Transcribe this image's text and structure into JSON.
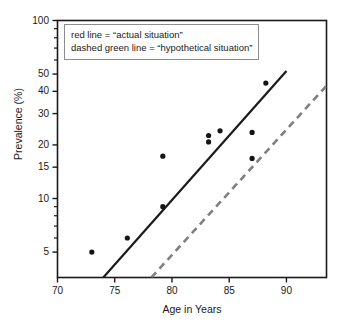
{
  "chart_data": {
    "type": "scatter",
    "title": "",
    "xlabel": "Age in Years",
    "ylabel": "Prevalence (%)",
    "yscale": "log",
    "xlim": [
      70,
      93.5
    ],
    "ylim": [
      3.6,
      100
    ],
    "grid": false,
    "x_ticks": [
      70,
      75,
      80,
      85,
      90
    ],
    "x_tick_labels": [
      "70",
      "75",
      "80",
      "85",
      "90"
    ],
    "y_ticks": [
      5,
      10,
      15,
      20,
      30,
      40,
      50,
      100
    ],
    "y_tick_labels": [
      "5",
      "10",
      "15",
      "20",
      "30",
      "40",
      "50",
      "100"
    ],
    "y_minor_ticks": [
      6,
      7,
      8,
      9,
      60,
      70,
      80,
      90
    ],
    "points": [
      {
        "x": 73.0,
        "y": 5.0
      },
      {
        "x": 76.1,
        "y": 6.0
      },
      {
        "x": 79.2,
        "y": 9.0
      },
      {
        "x": 79.2,
        "y": 17.3
      },
      {
        "x": 83.2,
        "y": 20.8
      },
      {
        "x": 83.2,
        "y": 22.6
      },
      {
        "x": 84.2,
        "y": 24.0
      },
      {
        "x": 87.0,
        "y": 16.8
      },
      {
        "x": 87.0,
        "y": 23.5
      },
      {
        "x": 88.2,
        "y": 44.5
      }
    ],
    "series": [
      {
        "name": "actual situation",
        "style": "solid",
        "color": "#1a1a1a",
        "x_start": 74.0,
        "y_start": 3.6,
        "x_end": 90.0,
        "y_end": 52.0
      },
      {
        "name": "hypothetical situation",
        "style": "dashed",
        "color": "#808080",
        "x_start": 78.2,
        "y_start": 3.6,
        "x_end": 93.5,
        "y_end": 43.0
      }
    ],
    "legend": {
      "position": "top-left",
      "lines": [
        "red line = “actual situation”",
        "dashed green line = “hypothetical situation”"
      ]
    }
  },
  "colors": {
    "axis": "#1a1a1a",
    "marker": "#141414",
    "solid_line": "#1a1a1a",
    "dashed_line": "#8a8a8a",
    "legend_border": "#8d8d8d",
    "background": "#ffffff"
  }
}
